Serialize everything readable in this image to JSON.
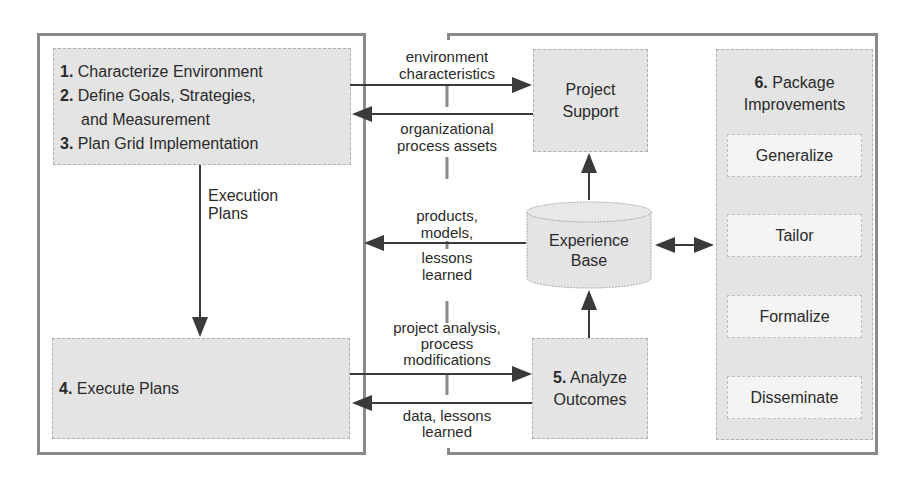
{
  "left_panel": {
    "steps_box": {
      "items": [
        {
          "num": "1.",
          "text": "Characterize Environment"
        },
        {
          "num": "2.",
          "text": "Define Goals, Strategies,"
        },
        {
          "num": "",
          "text": "and Measurement"
        },
        {
          "num": "3.",
          "text": "Plan Grid Implementation"
        }
      ]
    },
    "execution_label": [
      "Execution",
      "Plans"
    ],
    "execute_box": {
      "num": "4.",
      "text": "Execute Plans"
    }
  },
  "middle_labels": {
    "env": [
      "environment",
      "characteristics"
    ],
    "org": [
      "organizational",
      "process assets"
    ],
    "products": [
      "products,",
      "models,"
    ],
    "lessons": [
      "lessons",
      "learned"
    ],
    "analysis": [
      "project analysis,",
      "process",
      "modifications"
    ],
    "data": [
      "data, lessons",
      "learned"
    ]
  },
  "project_support": [
    "Project",
    "Support"
  ],
  "experience_base": [
    "Experience",
    "Base"
  ],
  "analyze_box": {
    "num": "5.",
    "line1": "Analyze",
    "line2": "Outcomes"
  },
  "package_panel": {
    "num": "6.",
    "title1": "Package",
    "title2": "Improvements",
    "items": [
      "Generalize",
      "Tailor",
      "Formalize",
      "Disseminate"
    ]
  },
  "colors": {
    "frame": "#8a8a8a",
    "box": "#e4e4e4",
    "arrow": "#3a3a3a"
  }
}
